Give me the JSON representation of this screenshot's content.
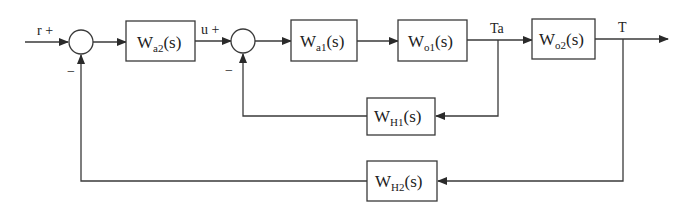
{
  "diagram": {
    "type": "control block diagram (cascade feedback loop)",
    "signals": {
      "input": "r",
      "input_sign": "+",
      "intermediate": "u",
      "intermediate_sign": "+",
      "inner_output": "Ta",
      "output": "T",
      "feedback_sign_outer": "−",
      "feedback_sign_inner": "−"
    },
    "blocks": [
      {
        "id": "wa2",
        "base": "W",
        "sub": "a2",
        "arg": "(s)"
      },
      {
        "id": "wa1",
        "base": "W",
        "sub": "a1",
        "arg": "(s)"
      },
      {
        "id": "wo1",
        "base": "W",
        "sub": "o1",
        "arg": "(s)"
      },
      {
        "id": "wo2",
        "base": "W",
        "sub": "o2",
        "arg": "(s)"
      },
      {
        "id": "wh1",
        "base": "W",
        "sub": "H1",
        "arg": "(s)"
      },
      {
        "id": "wh2",
        "base": "W",
        "sub": "H2",
        "arg": "(s)"
      }
    ],
    "connections": [
      "r -> sum1(+)",
      "sum1 -> Wa2(s) -> u",
      "u -> sum2(+)",
      "sum2 -> Wa1(s) -> Wo1(s) -> Ta",
      "Ta -> Wo2(s) -> T",
      "Ta -> WH1(s) -> sum2(−)",
      "T -> WH2(s) -> sum1(−)"
    ]
  }
}
